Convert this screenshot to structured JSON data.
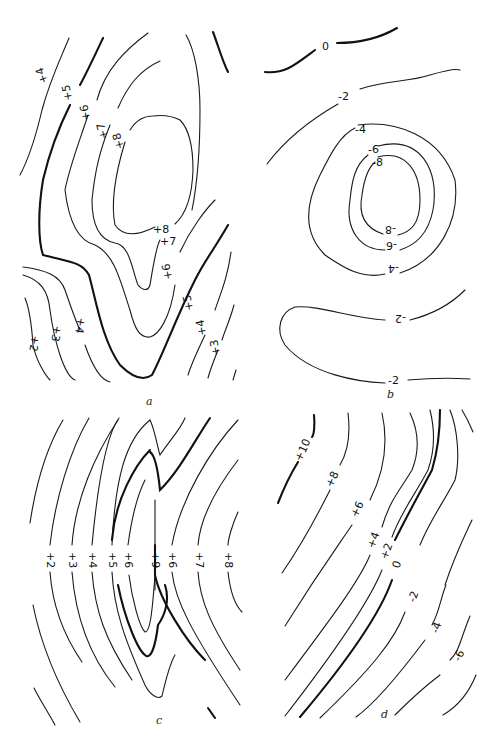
{
  "figure": {
    "panels": [
      {
        "id": "a",
        "caption": "a",
        "contour_labels": [
          "+2",
          "+3",
          "+4",
          "+4",
          "+5",
          "+5",
          "+6",
          "+6",
          "+7",
          "+7",
          "+8",
          "+8",
          "+3",
          "+4"
        ],
        "description": "Closed high (max +8) elongated north-south, bold +5 contour"
      },
      {
        "id": "b",
        "caption": "b",
        "contour_labels": [
          "0",
          "-2",
          "-4",
          "-6",
          "-8",
          "-8",
          "-6",
          "-4",
          "-2",
          "-2"
        ],
        "description": "Closed low (min -8) centered upper-middle, open -2 contours"
      },
      {
        "id": "c",
        "caption": "c",
        "contour_labels": [
          "+2",
          "+3",
          "+4",
          "+5",
          "+6",
          "+9",
          "+6",
          "+7",
          "+8"
        ],
        "description": "Parallel curved contours with ridge +9, bold +5 and +6 lines"
      },
      {
        "id": "d",
        "caption": "d",
        "contour_labels": [
          "+10",
          "+8",
          "+6",
          "+4",
          "+2",
          "0",
          "-2",
          "-4",
          "-6"
        ],
        "description": "Diagonal gradient from +10 (upper-left) to -6 (lower-right), bold 0 line"
      }
    ],
    "labels": {
      "a": {
        "p4": "+4",
        "p5": "+5",
        "p6": "+6",
        "p7": "+7",
        "p8": "+8",
        "p8b": "+8",
        "p7b": "+7",
        "p6b": "+6",
        "p5b": "+5",
        "p4b": "+4",
        "p3b": "+3",
        "p2": "+2",
        "p3": "+3",
        "p4c": "+4"
      },
      "b": {
        "z0": "0",
        "m2": "-2",
        "m4": "-4",
        "m6": "-6",
        "m8": "-8",
        "m8b": "-8",
        "m6b": "-6",
        "m4b": "-4",
        "m2b": "-2",
        "m2c": "-2"
      },
      "c": {
        "p2": "+2",
        "p3": "+3",
        "p4": "+4",
        "p5": "+5",
        "p6": "+6",
        "p9": "+9",
        "p6b": "+6",
        "p7": "+7",
        "p8": "+8"
      },
      "d": {
        "p10": "+10",
        "p8": "+8",
        "p6": "+6",
        "p4": "+4",
        "p2": "+2",
        "z0": "0",
        "m2": "-2",
        "m4": "-4",
        "m6": "-6"
      }
    }
  }
}
